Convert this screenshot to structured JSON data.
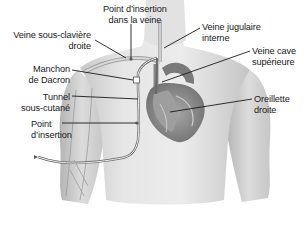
{
  "diagram": {
    "type": "anatomical-illustration",
    "labels": [
      {
        "id": "insertion-point-vein",
        "line1": "Point d’insertion",
        "line2": "dans la veine"
      },
      {
        "id": "right-subclavian-vein",
        "line1": "Veine sous-clavière",
        "line2": "droite"
      },
      {
        "id": "internal-jugular-vein",
        "line1": "Veine jugulaire",
        "line2": "interne"
      },
      {
        "id": "superior-vena-cava",
        "line1": "Veine cave",
        "line2": "supérieure"
      },
      {
        "id": "dacron-cuff",
        "line1": "Manchon",
        "line2": "de Dacron"
      },
      {
        "id": "subcutaneous-tunnel",
        "line1": "Tunnel",
        "line2": "sous-cutané"
      },
      {
        "id": "right-atrium",
        "line1": "Oreillette",
        "line2": "droite"
      },
      {
        "id": "insertion-point",
        "line1": "Point",
        "line2": "d’insertion"
      }
    ]
  },
  "colors": {
    "skin_light": "#eeeeee",
    "skin_mid": "#d6d6d6",
    "skin_dark": "#b8b8b8",
    "leader_line": "#1a1a1a",
    "catheter": "#888888",
    "heart_dark": "#6a6a6a",
    "heart_mid": "#9a9a9a"
  }
}
